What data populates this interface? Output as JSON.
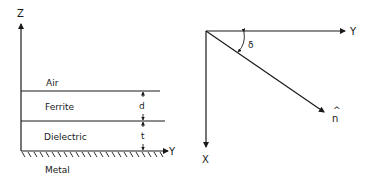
{
  "left_diagram": {
    "axis_z_label": "Z",
    "axis_y_label": "Y",
    "layers": [
      {
        "name": "Air"
      },
      {
        "name": "Ferrite",
        "thickness_label": "d"
      },
      {
        "name": "Dielectric",
        "thickness_label": "t"
      },
      {
        "name": "Metal"
      }
    ]
  },
  "right_diagram": {
    "axis_y_label": "Y",
    "axis_x_label": "X",
    "vector_label": "n",
    "vector_hat": "^",
    "angle_label": "δ"
  }
}
